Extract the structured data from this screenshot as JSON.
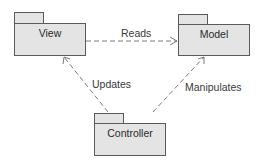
{
  "diagram": {
    "type": "UML package diagram (MVC)",
    "nodes": [
      {
        "id": "view",
        "label": "View",
        "kind": "package"
      },
      {
        "id": "model",
        "label": "Model",
        "kind": "package"
      },
      {
        "id": "controller",
        "label": "Controller",
        "kind": "package"
      }
    ],
    "edges": [
      {
        "from": "view",
        "to": "model",
        "label": "Reads",
        "style": "dashed",
        "arrow": "open"
      },
      {
        "from": "controller",
        "to": "view",
        "label": "Updates",
        "style": "dashed",
        "arrow": "open"
      },
      {
        "from": "controller",
        "to": "model",
        "label": "Manipulates",
        "style": "dashed",
        "arrow": "open"
      }
    ],
    "colors": {
      "package_fill": "#e4e4e4",
      "package_border": "#5a5a5a",
      "edge": "#7a7a7a",
      "text": "#2a2a2a"
    }
  }
}
